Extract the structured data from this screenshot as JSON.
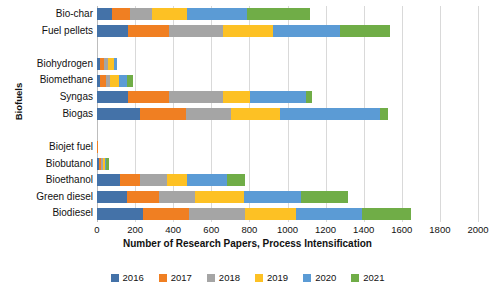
{
  "chart_data": {
    "type": "bar",
    "orientation": "horizontal",
    "stacked": true,
    "title": "",
    "xlabel": "Number of Research Papers, Process Intensification",
    "ylabel": "Biofuels",
    "xlim": [
      0,
      2000
    ],
    "xticks": [
      0,
      200,
      400,
      600,
      800,
      1000,
      1200,
      1400,
      1600,
      1800,
      2000
    ],
    "grid": "vertical",
    "legend_position": "bottom",
    "legend": [
      "2016",
      "2017",
      "2018",
      "2019",
      "2020",
      "2021"
    ],
    "colors": [
      "#4472a8",
      "#f07f22",
      "#a5a5a5",
      "#fdc124",
      "#5b9bd5",
      "#70ad47"
    ],
    "categories": [
      "Bio-char",
      "Fuel pellets",
      "",
      "Biohydrogen",
      "Biomethane",
      "Syngas",
      "Biogas",
      "",
      "Biojet fuel",
      "Biobutanol",
      "Bioethanol",
      "Green diesel",
      "Biodiesel"
    ],
    "series": [
      {
        "name": "2016",
        "values": [
          80,
          165,
          0,
          15,
          15,
          165,
          225,
          0,
          0,
          10,
          120,
          160,
          240
        ]
      },
      {
        "name": "2017",
        "values": [
          95,
          215,
          0,
          20,
          30,
          215,
          240,
          0,
          5,
          10,
          105,
          165,
          245
        ]
      },
      {
        "name": "2018",
        "values": [
          115,
          280,
          0,
          25,
          25,
          280,
          240,
          0,
          0,
          10,
          140,
          190,
          290
        ]
      },
      {
        "name": "2019",
        "values": [
          180,
          265,
          0,
          30,
          45,
          145,
          255,
          0,
          0,
          10,
          105,
          255,
          270
        ]
      },
      {
        "name": "2020",
        "values": [
          315,
          350,
          0,
          15,
          45,
          290,
          525,
          0,
          0,
          10,
          215,
          300,
          345
        ]
      },
      {
        "name": "2021",
        "values": [
          335,
          265,
          0,
          0,
          30,
          35,
          45,
          0,
          0,
          15,
          90,
          250,
          260
        ]
      }
    ],
    "totals": [
      1120,
      1540,
      0,
      105,
      190,
      1130,
      1530,
      0,
      5,
      65,
      775,
      1320,
      1650
    ]
  }
}
